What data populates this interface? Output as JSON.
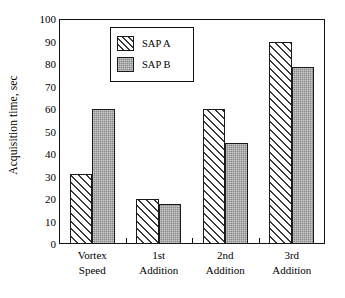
{
  "chart_data": {
    "type": "bar",
    "title": "",
    "subtitle": "",
    "xlabel": "",
    "ylabel": "Acquisition time, sec",
    "categories": [
      "Vortex Speed",
      "1st Addition",
      "2nd Addition",
      "3rd Addition"
    ],
    "category_lines": [
      [
        "Vortex",
        "Speed"
      ],
      [
        "1st",
        "Addition"
      ],
      [
        "2nd",
        "Addition"
      ],
      [
        "3rd",
        "Addition"
      ]
    ],
    "series": [
      {
        "name": "SAP A",
        "values": [
          31,
          20,
          60,
          90
        ]
      },
      {
        "name": "SAP B",
        "values": [
          60,
          18,
          45,
          78.5
        ]
      }
    ],
    "ylim": [
      0,
      100
    ],
    "yticks": [
      0,
      10,
      20,
      30,
      40,
      50,
      60,
      70,
      80,
      90,
      100
    ],
    "ytick_labels": [
      "0",
      "10",
      "20",
      "30",
      "40",
      "50",
      "60",
      "70",
      "80",
      "90",
      "100"
    ],
    "grid": false,
    "legend_position": "upper-left-inside",
    "legend_entries": [
      "SAP A",
      "SAP B"
    ],
    "colors": {
      "sap_a_fill": "#ffffff",
      "sap_a_hatch": "#3a3a3a",
      "sap_b_fill": "#8a8a8a",
      "axis": "#111111",
      "background": "#ffffff"
    }
  }
}
